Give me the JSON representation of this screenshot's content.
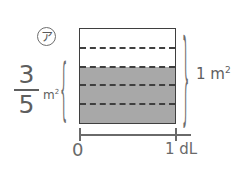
{
  "figure": {
    "kind": "area-model-fraction-diagram",
    "marker": {
      "label": "ア",
      "icon": "circled-katakana-a"
    },
    "left_quantity": {
      "numerator": "3",
      "denominator": "5",
      "unit": "m",
      "unit_exponent": "2",
      "brace": "{"
    },
    "right_quantity": {
      "value": "1",
      "unit": "m",
      "unit_exponent": "2",
      "brace": "}"
    },
    "square": {
      "total_bands": 5,
      "shaded_bands": 3,
      "unshaded_bands": 2,
      "shade_color": "#a8a8a8",
      "outline_color": "#3f3f3f",
      "divider_style": "dashed",
      "bands": [
        {
          "shaded": false
        },
        {
          "shaded": false
        },
        {
          "shaded": true
        },
        {
          "shaded": true
        },
        {
          "shaded": true
        }
      ]
    },
    "axis": {
      "start_label": "0",
      "end_label": "1 dL",
      "ticks": [
        "0",
        "1 dL"
      ],
      "color": "#6a6a6a"
    }
  },
  "chart_data": {
    "type": "bar",
    "title": "",
    "xlabel": "dL",
    "ylabel": "m²",
    "categories": [
      "0 – 1 dL"
    ],
    "values": [
      0.6
    ],
    "ylim": [
      0,
      1
    ],
    "x": [
      0,
      1
    ],
    "annotations": [
      {
        "text": "3/5 m²",
        "target": "shaded-region"
      },
      {
        "text": "1 m²",
        "target": "whole-square"
      },
      {
        "text": "1 dL",
        "target": "x-axis-end"
      },
      {
        "text": "0",
        "target": "x-axis-origin"
      }
    ],
    "grid": true,
    "legend": "none"
  }
}
